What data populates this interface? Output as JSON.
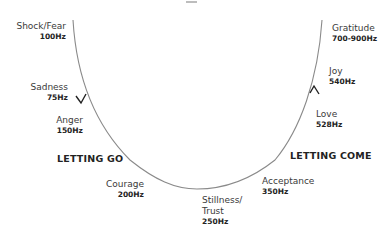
{
  "diagram": {
    "type": "emotional-frequency-curve",
    "sections": {
      "left": "LETTING GO",
      "right": "LETTING COME"
    },
    "left_nodes": [
      {
        "name": "Shock/Fear",
        "hz": "100Hz"
      },
      {
        "name": "Sadness",
        "hz": "75Hz"
      },
      {
        "name": "Anger",
        "hz": "150Hz"
      },
      {
        "name": "Courage",
        "hz": "200Hz"
      }
    ],
    "bottom_node": {
      "name_line1": "Stillness/",
      "name_line2": "Trust",
      "hz": "250Hz"
    },
    "right_nodes": [
      {
        "name": "Acceptance",
        "hz": "350Hz"
      },
      {
        "name": "Love",
        "hz": "528Hz"
      },
      {
        "name": "Joy",
        "hz": "540Hz"
      },
      {
        "name": "Gratitude",
        "hz": "700-900Hz"
      }
    ],
    "colors": {
      "curve": "#8a8a8a",
      "text": "#3a3a3a",
      "bold_text": "#222222"
    }
  }
}
